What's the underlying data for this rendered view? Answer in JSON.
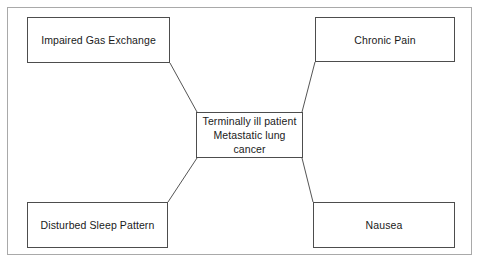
{
  "diagram": {
    "type": "concept-map",
    "center": {
      "id": "center",
      "label": "Terminally ill patient\nMetastatic lung cancer",
      "line1": "Terminally ill patient",
      "line2": "Metastatic lung cancer"
    },
    "nodes": [
      {
        "id": "impaired-gas-exchange",
        "label": "Impaired Gas Exchange",
        "position": "top-left"
      },
      {
        "id": "chronic-pain",
        "label": "Chronic Pain",
        "position": "top-right"
      },
      {
        "id": "disturbed-sleep-pattern",
        "label": "Disturbed Sleep Pattern",
        "position": "bottom-left"
      },
      {
        "id": "nausea",
        "label": "Nausea",
        "position": "bottom-right"
      }
    ],
    "connectors": [
      {
        "from": "impaired-gas-exchange",
        "to": "center",
        "x1": 170,
        "y1": 63,
        "x2": 197,
        "y2": 112
      },
      {
        "from": "chronic-pain",
        "to": "center",
        "x1": 315,
        "y1": 62,
        "x2": 302,
        "y2": 112
      },
      {
        "from": "disturbed-sleep-pattern",
        "to": "center",
        "x1": 168,
        "y1": 202,
        "x2": 197,
        "y2": 158
      },
      {
        "from": "nausea",
        "to": "center",
        "x1": 313,
        "y1": 202,
        "x2": 302,
        "y2": 158
      }
    ],
    "colors": {
      "node_border": "#4d4d4d",
      "node_fill": "#ffffff",
      "connector": "#555555",
      "frame_border": "#a9a9a9",
      "text": "#1a1a1a",
      "background": "#ffffff"
    }
  }
}
